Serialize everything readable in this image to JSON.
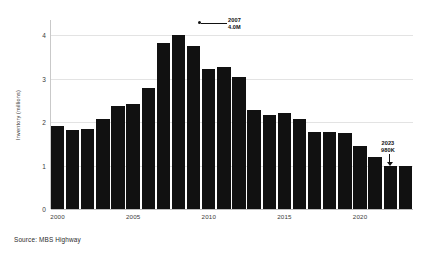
{
  "chart_data": {
    "type": "bar",
    "title": "",
    "subtitle": "",
    "xlabel": "",
    "ylabel": "Inventory (millions)",
    "ylim": [
      0,
      4.35
    ],
    "yticks": [
      "0",
      "1",
      "2",
      "3",
      "4"
    ],
    "ytick_values": [
      0,
      1,
      2,
      3,
      4
    ],
    "xticks": [
      "2000",
      "2005",
      "2010",
      "2015",
      "2020"
    ],
    "xtick_values": [
      2000,
      2005,
      2010,
      2015,
      2020
    ],
    "grid": true,
    "legend": null,
    "bar_color": "#111111",
    "categories": [
      "2000",
      "2001",
      "2002",
      "2003",
      "2004",
      "2005",
      "2006",
      "2007",
      "2008",
      "2009",
      "2010",
      "2011",
      "2012",
      "2013",
      "2014",
      "2015",
      "2016",
      "2017",
      "2018",
      "2019",
      "2020",
      "2021",
      "2022",
      "2023"
    ],
    "values": [
      1.9,
      1.81,
      1.84,
      2.08,
      2.37,
      2.42,
      2.78,
      3.81,
      4.0,
      3.75,
      3.22,
      3.26,
      3.03,
      2.27,
      2.17,
      2.22,
      2.07,
      1.78,
      1.78,
      1.76,
      1.45,
      1.19,
      0.98,
      0.98
    ],
    "annotations": [
      {
        "id": "peak",
        "target_category": "2007",
        "label_line1": "2007",
        "label_line2": "4.0M",
        "style": "leader-line-right"
      },
      {
        "id": "last",
        "target_category": "2023",
        "label_line1": "2023",
        "label_line2": "980K",
        "style": "arrow-down"
      }
    ]
  },
  "source": {
    "note": "Source: MBS Highway"
  }
}
